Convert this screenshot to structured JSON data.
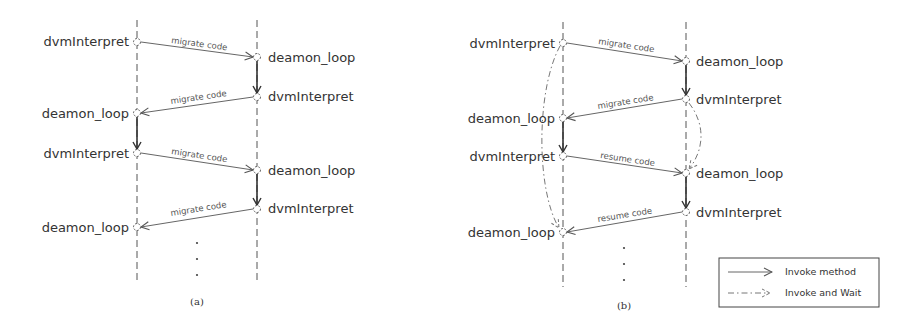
{
  "panels": [
    {
      "caption": "(a)",
      "lifeline_left": {
        "x": 137,
        "top": 20,
        "bottom": 282
      },
      "lifeline_right": {
        "x": 257,
        "top": 20,
        "bottom": 282
      },
      "left_nodes": [
        {
          "label": "dvmInterpret",
          "y": 42
        },
        {
          "label": "deamon_loop",
          "y": 113
        },
        {
          "label": "dvmInterpret",
          "y": 153
        },
        {
          "label": "deamon_loop",
          "y": 227
        }
      ],
      "right_nodes": [
        {
          "label": "deamon_loop",
          "y": 57
        },
        {
          "label": "dvmInterpret",
          "y": 97
        },
        {
          "label": "deamon_loop",
          "y": 170
        },
        {
          "label": "dvmInterpret",
          "y": 209
        }
      ],
      "messages": [
        {
          "label": "migrate code",
          "direction": "right"
        },
        {
          "label": "migrate code",
          "direction": "left"
        },
        {
          "label": "migrate code",
          "direction": "right"
        },
        {
          "label": "migrate code",
          "direction": "left"
        }
      ],
      "continuation": "⋮"
    },
    {
      "caption": "(b)",
      "lifeline_left": {
        "x": 563,
        "top": 22,
        "bottom": 287
      },
      "lifeline_right": {
        "x": 686,
        "top": 22,
        "bottom": 287
      },
      "left_nodes": [
        {
          "label": "dvmInterpret",
          "y": 43
        },
        {
          "label": "deamon_loop",
          "y": 118
        },
        {
          "label": "dvmInterpret",
          "y": 156
        },
        {
          "label": "deamon_loop",
          "y": 232
        }
      ],
      "right_nodes": [
        {
          "label": "deamon_loop",
          "y": 61
        },
        {
          "label": "dvmInterpret",
          "y": 99
        },
        {
          "label": "deamon_loop",
          "y": 173
        },
        {
          "label": "dvmInterpret",
          "y": 212
        }
      ],
      "messages": [
        {
          "label": "migrate code",
          "direction": "right"
        },
        {
          "label": "migrate code",
          "direction": "left"
        },
        {
          "label": "resume code",
          "direction": "right"
        },
        {
          "label": "resume code",
          "direction": "left"
        }
      ],
      "continuation": "⋮"
    }
  ],
  "legend": {
    "items": [
      {
        "label": "Invoke method",
        "style": "solid"
      },
      {
        "label": "Invoke and Wait",
        "style": "dash-dot"
      }
    ]
  },
  "colors": {
    "line": "#666666",
    "text": "#333333",
    "background": "#ffffff"
  }
}
